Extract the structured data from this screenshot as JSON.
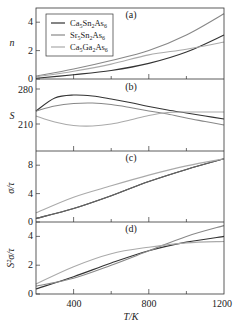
{
  "chart_data": [
    {
      "type": "line",
      "panel": "(a)",
      "ylabel": "n",
      "xlabel": "",
      "xlim": [
        200,
        1200
      ],
      "ylim": [
        0,
        5
      ],
      "yticks": [
        0,
        2,
        4
      ],
      "x": [
        200,
        400,
        600,
        800,
        1000,
        1200
      ],
      "series": [
        {
          "name": "Ca5Sn2As6",
          "color": "#333333",
          "values": [
            0.05,
            0.3,
            0.6,
            1.1,
            1.9,
            3.1
          ]
        },
        {
          "name": "Sr5Sn2As6",
          "color": "#888888",
          "values": [
            0.2,
            0.7,
            1.3,
            2.0,
            3.1,
            4.6
          ]
        },
        {
          "name": "Ca5Ga2As6",
          "color": "#aaaaaa",
          "values": [
            0.15,
            0.55,
            1.05,
            1.7,
            2.1,
            2.6
          ]
        }
      ],
      "legend_position": "upper left"
    },
    {
      "type": "line",
      "panel": "(b)",
      "ylabel": "S",
      "xlabel": "",
      "xlim": [
        200,
        1200
      ],
      "ylim": [
        156,
        300
      ],
      "yticks": [
        210,
        280
      ],
      "x": [
        200,
        300,
        400,
        500,
        600,
        700,
        800,
        900,
        1000,
        1100,
        1200
      ],
      "series": [
        {
          "name": "Ca5Sn2As6",
          "color": "#333333",
          "values": [
            236,
            262,
            268,
            266,
            260,
            253,
            245,
            238,
            232,
            226,
            220
          ]
        },
        {
          "name": "Sr5Sn2As6",
          "color": "#888888",
          "values": [
            236,
            246,
            251,
            252,
            249,
            243,
            236,
            230,
            222,
            215,
            208
          ]
        },
        {
          "name": "Ca5Ga2As6",
          "color": "#aaaaaa",
          "values": [
            226,
            214,
            207,
            206,
            210,
            218,
            227,
            233,
            234,
            234,
            234
          ]
        }
      ]
    },
    {
      "type": "line",
      "panel": "(c)",
      "ylabel": "σ/τ",
      "xlabel": "",
      "xlim": [
        200,
        1200
      ],
      "ylim": [
        0,
        10
      ],
      "yticks": [
        0,
        4,
        8
      ],
      "x": [
        200,
        400,
        600,
        800,
        1000,
        1200
      ],
      "series": [
        {
          "name": "Ca5Sn2As6",
          "color": "#333333",
          "values": [
            0.5,
            1.9,
            3.7,
            5.7,
            7.4,
            8.9
          ]
        },
        {
          "name": "Sr5Sn2As6",
          "color": "#666666",
          "values": [
            0.5,
            1.9,
            3.7,
            5.7,
            7.4,
            8.9
          ]
        },
        {
          "name": "Ca5Ga2As6",
          "color": "#aaaaaa",
          "values": [
            1.3,
            3.5,
            5.1,
            6.6,
            7.9,
            8.9
          ]
        }
      ]
    },
    {
      "type": "line",
      "panel": "(d)",
      "ylabel": "S²σ/τ",
      "xlabel": "T/K",
      "xlim": [
        200,
        1200
      ],
      "ylim": [
        0,
        5
      ],
      "yticks": [
        0,
        2,
        4
      ],
      "xticks": [
        400,
        800,
        1200
      ],
      "x": [
        200,
        400,
        600,
        800,
        1000,
        1200
      ],
      "series": [
        {
          "name": "Ca5Sn2As6",
          "color": "#333333",
          "values": [
            0.35,
            1.2,
            2.15,
            3.0,
            3.6,
            4.0
          ]
        },
        {
          "name": "Sr5Sn2As6",
          "color": "#888888",
          "values": [
            0.55,
            1.1,
            2.0,
            3.0,
            4.0,
            4.75
          ]
        },
        {
          "name": "Ca5Ga2As6",
          "color": "#aaaaaa",
          "values": [
            0.7,
            1.9,
            2.8,
            3.25,
            3.55,
            3.65
          ]
        }
      ]
    }
  ],
  "axes": {
    "x_tick_labels": [
      "400",
      "800",
      "1200"
    ],
    "x_label": "T/K",
    "panel_a": {
      "label": "(a)",
      "ylabel": "n",
      "yticks": [
        "0",
        "2",
        "4"
      ]
    },
    "panel_b": {
      "label": "(b)",
      "ylabel": "S",
      "yticks": [
        "210",
        "280"
      ]
    },
    "panel_c": {
      "label": "(c)",
      "ylabel": "σ/τ",
      "yticks": [
        "0",
        "4",
        "8"
      ]
    },
    "panel_d": {
      "label": "(d)",
      "ylabel": "S²σ/τ",
      "yticks": [
        "0",
        "2",
        "4"
      ]
    }
  },
  "legend": [
    {
      "label_base": "Ca",
      "sub1": "5",
      "mid": "Sn",
      "sub2": "2",
      "end": "As",
      "sub3": "6",
      "color": "#333333"
    },
    {
      "label_base": "Sr",
      "sub1": "5",
      "mid": "Sn",
      "sub2": "2",
      "end": "As",
      "sub3": "6",
      "color": "#888888"
    },
    {
      "label_base": "Ca",
      "sub1": "5",
      "mid": "Ga",
      "sub2": "2",
      "end": "As",
      "sub3": "6",
      "color": "#aaaaaa"
    }
  ]
}
